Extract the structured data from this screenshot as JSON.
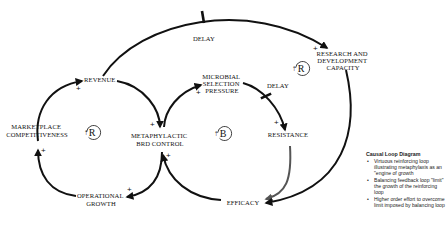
{
  "diagram": {
    "type": "causal_loop_diagram",
    "nodes": {
      "revenue": "REVENUE",
      "marketplace_1": "MARKETPLACE",
      "marketplace_2": "COMPETITIVENESS",
      "metaphylactic_1": "METAPHYLACTIC",
      "metaphylactic_2": "BRD CONTROL",
      "operational_1": "OPERATIONAL",
      "operational_2": "GROWTH",
      "microbial_1": "MICROBIAL",
      "microbial_2": "SELECTION",
      "microbial_3": "PRESSURE",
      "resistance": "RESISTANCE",
      "efficacy": "EFFICACY",
      "research_1": "RESEARCH AND",
      "research_2": "DEVELOPMENT",
      "research_3": "CAPACITY"
    },
    "delay_labels": {
      "top": "DELAY",
      "middle": "DELAY"
    },
    "loops": {
      "left": "R",
      "middle": "B",
      "top_right": "R"
    },
    "polarity": {
      "plus": "+",
      "minus": "-"
    },
    "links": [
      {
        "from": "REVENUE",
        "to": "METAPHYLACTIC BRD CONTROL",
        "polarity": "+"
      },
      {
        "from": "METAPHYLACTIC BRD CONTROL",
        "to": "OPERATIONAL GROWTH",
        "polarity": "+"
      },
      {
        "from": "OPERATIONAL GROWTH",
        "to": "MARKETPLACE COMPETITIVENESS",
        "polarity": "+"
      },
      {
        "from": "MARKETPLACE COMPETITIVENESS",
        "to": "REVENUE",
        "polarity": "+"
      },
      {
        "from": "METAPHYLACTIC BRD CONTROL",
        "to": "MICROBIAL SELECTION PRESSURE",
        "polarity": "+"
      },
      {
        "from": "MICROBIAL SELECTION PRESSURE",
        "to": "RESISTANCE",
        "polarity": "+",
        "delay": true
      },
      {
        "from": "RESISTANCE",
        "to": "EFFICACY",
        "polarity": "-"
      },
      {
        "from": "EFFICACY",
        "to": "METAPHYLACTIC BRD CONTROL",
        "polarity": "+"
      },
      {
        "from": "REVENUE",
        "to": "RESEARCH AND DEVELOPMENT CAPACITY",
        "polarity": "+",
        "delay": true
      },
      {
        "from": "RESEARCH AND DEVELOPMENT CAPACITY",
        "to": "EFFICACY",
        "polarity": "+"
      }
    ]
  },
  "legend": {
    "title": "Causal Loop Diagram",
    "items": [
      "Virtuous reinforcing loop illustrating metaphylaxis as an \"engine of growth",
      "Balancing feedback loop \"limit\" the growth of the reinforcing loop",
      "Higher order effort to overcome limit imposed by balancing loop"
    ]
  }
}
